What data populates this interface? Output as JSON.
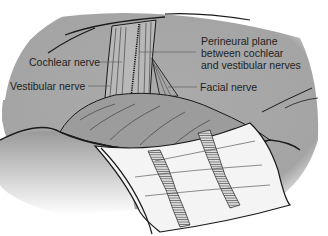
{
  "figure": {
    "colors": {
      "background": "#ffffff",
      "tissue_gray": "#a9a9a9",
      "dark_gray": "#8a8a8a",
      "line": "#1a1a1a",
      "cottonoid": "#f4f4f4"
    },
    "labels": {
      "cochlear": "Cochlear nerve",
      "vestibular": "Vestibular nerve",
      "perineural_line1": "Perineural plane",
      "perineural_line2": "between cochlear",
      "perineural_line3": "and vestibular nerves",
      "facial": "Facial nerve"
    }
  }
}
